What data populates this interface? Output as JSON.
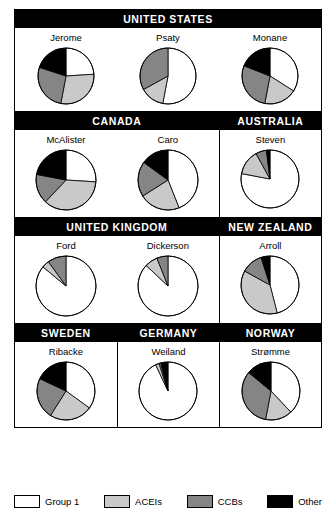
{
  "legend": {
    "items": [
      {
        "label": "Group 1",
        "color": "#ffffff",
        "key": "group1"
      },
      {
        "label": "ACEIs",
        "color": "#c9c9c9",
        "key": "acei"
      },
      {
        "label": "CCBs",
        "color": "#858585",
        "key": "ccb"
      },
      {
        "label": "Other",
        "color": "#000000",
        "key": "other"
      }
    ]
  },
  "rows": [
    {
      "countries": [
        {
          "name": "UNITED STATES",
          "width": 100,
          "studies": [
            {
              "name": "Jerome"
            },
            {
              "name": "Psaty"
            },
            {
              "name": "Monane"
            }
          ]
        }
      ]
    },
    {
      "countries": [
        {
          "name": "CANADA",
          "width": 66.6,
          "studies": [
            {
              "name": "McAlister"
            },
            {
              "name": "Caro"
            }
          ]
        },
        {
          "name": "AUSTRALIA",
          "width": 33.4,
          "studies": [
            {
              "name": "Steven"
            }
          ]
        }
      ]
    },
    {
      "countries": [
        {
          "name": "UNITED KINGDOM",
          "width": 66.6,
          "studies": [
            {
              "name": "Ford"
            },
            {
              "name": "Dickerson"
            }
          ]
        },
        {
          "name": "NEW ZEALAND",
          "width": 33.4,
          "studies": [
            {
              "name": "Arroll"
            }
          ]
        }
      ]
    },
    {
      "countries": [
        {
          "name": "SWEDEN",
          "width": 33.3,
          "studies": [
            {
              "name": "Ribacke"
            }
          ]
        },
        {
          "name": "GERMANY",
          "width": 33.4,
          "studies": [
            {
              "name": "Weiland"
            }
          ]
        },
        {
          "name": "NORWAY",
          "width": 33.3,
          "studies": [
            {
              "name": "Strømme"
            }
          ]
        }
      ]
    }
  ],
  "chart_data": {
    "type": "pie",
    "categories": [
      "Group 1",
      "ACEIs",
      "CCBs",
      "Other"
    ],
    "colors": [
      "#ffffff",
      "#c9c9c9",
      "#858585",
      "#000000"
    ],
    "units": "percent",
    "start_angle_deg": -90,
    "direction": "clockwise",
    "charts": [
      {
        "country": "UNITED STATES",
        "name": "Jerome",
        "values": [
          24,
          29,
          27,
          20
        ]
      },
      {
        "country": "UNITED STATES",
        "name": "Psaty",
        "values": [
          53,
          14,
          33,
          0
        ]
      },
      {
        "country": "UNITED STATES",
        "name": "Monane",
        "values": [
          34,
          19,
          28,
          19
        ]
      },
      {
        "country": "CANADA",
        "name": "McAlister",
        "values": [
          26,
          36,
          16,
          22
        ]
      },
      {
        "country": "CANADA",
        "name": "Caro",
        "values": [
          44,
          22,
          19,
          15
        ]
      },
      {
        "country": "AUSTRALIA",
        "name": "Steven",
        "values": [
          78,
          14,
          6,
          2
        ]
      },
      {
        "country": "UNITED KINGDOM",
        "name": "Ford",
        "values": [
          86,
          4,
          10,
          0
        ]
      },
      {
        "country": "UNITED KINGDOM",
        "name": "Dickerson",
        "values": [
          87,
          7,
          6,
          0
        ]
      },
      {
        "country": "NEW ZEALAND",
        "name": "Arroll",
        "values": [
          46,
          37,
          12,
          5
        ]
      },
      {
        "country": "SWEDEN",
        "name": "Ribacke",
        "values": [
          35,
          24,
          23,
          18
        ]
      },
      {
        "country": "GERMANY",
        "name": "Weiland",
        "values": [
          93,
          2,
          1,
          4
        ]
      },
      {
        "country": "NORWAY",
        "name": "Strømme",
        "values": [
          38,
          15,
          33,
          14
        ]
      }
    ]
  }
}
